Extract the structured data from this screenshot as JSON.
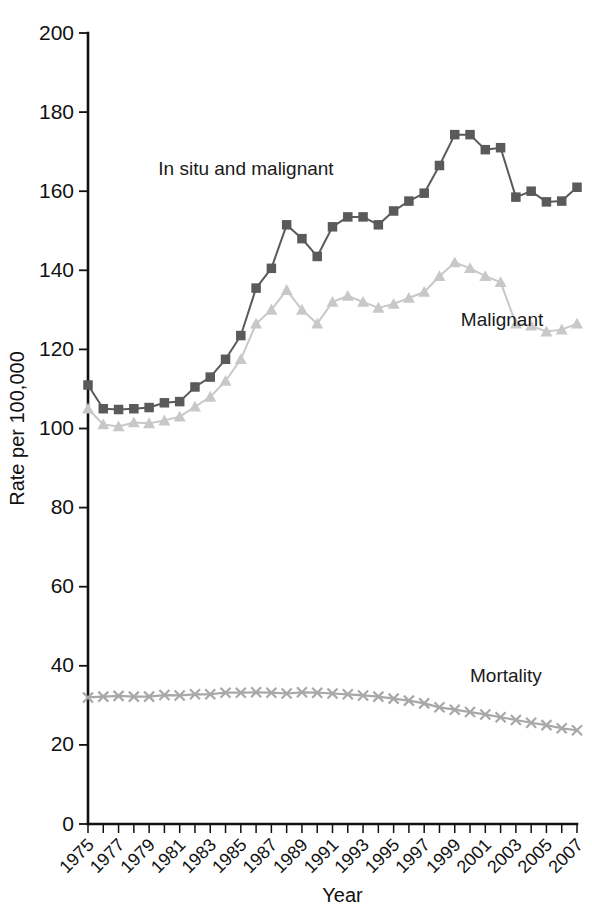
{
  "chart_data": {
    "type": "line",
    "title": "",
    "xlabel": "Year",
    "ylabel": "Rate per 100,000",
    "xlim": [
      1975,
      2007
    ],
    "ylim": [
      0,
      200
    ],
    "ytick_step": 20,
    "yticks": [
      0,
      20,
      40,
      60,
      80,
      100,
      120,
      140,
      160,
      180,
      200
    ],
    "ytick_labels": [
      "0",
      "20",
      "40",
      "60",
      "80",
      "100",
      "120",
      "140",
      "160",
      "180",
      "200"
    ],
    "xticks_all": [
      1975,
      1976,
      1977,
      1978,
      1979,
      1980,
      1981,
      1982,
      1983,
      1984,
      1985,
      1986,
      1987,
      1988,
      1989,
      1990,
      1991,
      1992,
      1993,
      1994,
      1995,
      1996,
      1997,
      1998,
      1999,
      2000,
      2001,
      2002,
      2003,
      2004,
      2005,
      2006,
      2007
    ],
    "xtick_labels": [
      "1975",
      "1977",
      "1979",
      "1981",
      "1983",
      "1985",
      "1987",
      "1989",
      "1991",
      "1993",
      "1995",
      "1997",
      "1999",
      "2001",
      "2003",
      "2005",
      "2007"
    ],
    "xtick_label_years": [
      1975,
      1977,
      1979,
      1981,
      1983,
      1985,
      1987,
      1989,
      1991,
      1993,
      1995,
      1997,
      1999,
      2001,
      2003,
      2005,
      2007
    ],
    "grid": false,
    "legend_position": "inline-annotations",
    "x": [
      1975,
      1976,
      1977,
      1978,
      1979,
      1980,
      1981,
      1982,
      1983,
      1984,
      1985,
      1986,
      1987,
      1988,
      1989,
      1990,
      1991,
      1992,
      1993,
      1994,
      1995,
      1996,
      1997,
      1998,
      1999,
      2000,
      2001,
      2002,
      2003,
      2004,
      2005,
      2006,
      2007
    ],
    "series": [
      {
        "name": "In situ and malignant",
        "color": "#5a5a5a",
        "marker": "square",
        "label_x": 1979.6,
        "label_y": 164.0,
        "values": [
          111.0,
          105.0,
          104.8,
          105.0,
          105.3,
          106.5,
          106.8,
          110.5,
          113.0,
          117.5,
          123.5,
          135.5,
          140.5,
          151.5,
          148.0,
          143.5,
          151.0,
          153.5,
          153.5,
          151.5,
          155.0,
          157.5,
          159.5,
          166.5,
          174.3,
          174.3,
          170.5,
          171.0,
          158.5,
          160.0,
          157.3,
          157.5,
          161.0
        ]
      },
      {
        "name": "Malignant",
        "color": "#c8c8c8",
        "marker": "triangle",
        "label_x": 1999.4,
        "label_y": 126.0,
        "values": [
          105.0,
          101.0,
          100.5,
          101.5,
          101.3,
          102.0,
          103.0,
          105.5,
          108.0,
          112.0,
          117.5,
          126.5,
          130.0,
          135.0,
          130.0,
          126.5,
          132.0,
          133.5,
          132.0,
          130.5,
          131.5,
          133.0,
          134.5,
          138.5,
          142.0,
          140.5,
          138.5,
          137.0,
          126.5,
          126.0,
          124.5,
          125.0,
          126.5
        ]
      },
      {
        "name": "Mortality",
        "color": "#a8a8a8",
        "marker": "x",
        "label_x": 2000.0,
        "label_y": 36.0,
        "values": [
          32.0,
          32.2,
          32.4,
          32.2,
          32.2,
          32.6,
          32.5,
          32.8,
          32.8,
          33.2,
          33.2,
          33.3,
          33.2,
          33.0,
          33.3,
          33.2,
          33.0,
          32.8,
          32.5,
          32.2,
          31.7,
          31.2,
          30.5,
          29.5,
          28.9,
          28.3,
          27.7,
          27.0,
          26.3,
          25.6,
          25.0,
          24.2,
          23.7
        ]
      }
    ]
  },
  "figure": {
    "background": "#ffffff",
    "axis_color": "#111111"
  }
}
